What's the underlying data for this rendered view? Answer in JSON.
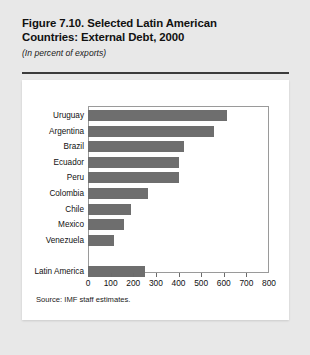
{
  "figure": {
    "title_line1": "Figure 7.10.  Selected Latin American",
    "title_line2": "Countries: External Debt, 2000",
    "subtitle": "(In percent of exports)",
    "source": "Source: IMF staff estimates."
  },
  "colors": {
    "bar": "#6e6e6e",
    "page_background": "#e8e8e8",
    "panel_background": "#ffffff",
    "rule": "#3b3b3b",
    "frame": "#9a9a9a",
    "text": "#111111"
  },
  "chart_data": {
    "type": "bar",
    "orientation": "horizontal",
    "title": "Figure 7.10.  Selected Latin American Countries: External Debt, 2000",
    "subtitle": "(In percent of exports)",
    "xlabel": "",
    "ylabel": "",
    "xlim": [
      0,
      800
    ],
    "xticks": [
      0,
      100,
      200,
      300,
      400,
      500,
      600,
      700,
      800
    ],
    "xtick_labels": [
      "0",
      "100",
      "200",
      "300",
      "400",
      "500",
      "600",
      "700",
      "800"
    ],
    "grid": false,
    "legend": false,
    "categories": [
      "Uruguay",
      "Argentina",
      "Brazil",
      "Ecuador",
      "Peru",
      "Colombia",
      "Chile",
      "Mexico",
      "Venezuela",
      "Latin America"
    ],
    "values": [
      615,
      555,
      425,
      400,
      400,
      265,
      190,
      158,
      115,
      253
    ],
    "separated_last_category": true,
    "source": "Source: IMF staff estimates."
  }
}
